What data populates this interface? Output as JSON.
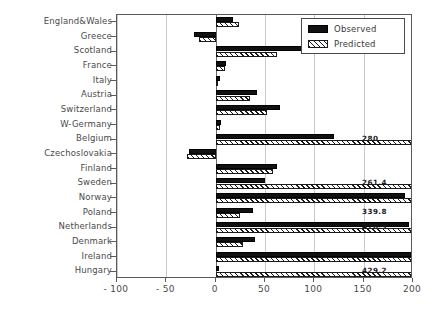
{
  "chart_data": {
    "type": "bar",
    "orientation": "horizontal",
    "title": "",
    "xlabel": "",
    "ylabel": "",
    "xlim": [
      -100,
      200
    ],
    "xticks": [
      -100,
      -50,
      0,
      50,
      100,
      150,
      200
    ],
    "xtick_labels": [
      "- 100",
      "- 50",
      "0",
      "50",
      "100",
      "150",
      "200"
    ],
    "grid": true,
    "grid_axis": "x",
    "legend_position": "top-right",
    "categories": [
      "England&Wales",
      "Greece",
      "Scotland",
      "France",
      "Italy",
      "Austria",
      "Switzerland",
      "W-Germany",
      "Belgium",
      "Czechoslovakia",
      "Finland",
      "Sweden",
      "Norway",
      "Poland",
      "Netherlands",
      "Denmark",
      "Ireland",
      "Hungary"
    ],
    "series": [
      {
        "name": "Observed",
        "fill": "solid-black",
        "values": [
          18,
          -22,
          95,
          10,
          4,
          42,
          65,
          5,
          120,
          -27,
          62,
          50,
          192,
          38,
          196,
          40,
          199,
          3
        ]
      },
      {
        "name": "Predicted",
        "fill": "hatched",
        "values": [
          24,
          -17,
          62,
          9,
          2,
          35,
          52,
          4,
          280,
          -29,
          58,
          261.4,
          200,
          25,
          339.8,
          28,
          476.9,
          429.2
        ]
      }
    ],
    "overflow_labels": [
      {
        "category": "Belgium",
        "value": "280"
      },
      {
        "category": "Sweden",
        "value": "261.4"
      },
      {
        "category": "Poland",
        "value": "339.8"
      },
      {
        "category": "Netherlands",
        "value": "476.9"
      },
      {
        "category": "Hungary",
        "value": "429.2"
      }
    ]
  },
  "legend": {
    "entries": [
      {
        "label": "Observed"
      },
      {
        "label": "Predicted"
      }
    ]
  }
}
